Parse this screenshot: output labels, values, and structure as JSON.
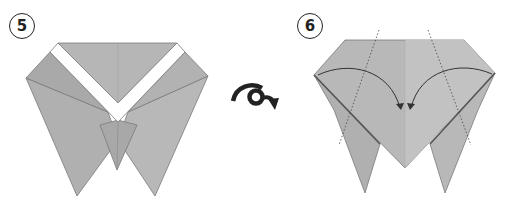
{
  "steps": [
    {
      "number": "5",
      "description": "Model with white V-shaped band across top, two pointed lower flaps"
    },
    {
      "number": "6",
      "description": "Fold side corners to center along dotted lines"
    }
  ],
  "symbols": {
    "turn_over": "turn-over-symbol"
  },
  "colors": {
    "paper": "#b3b3b3",
    "paper_light": "#c4c4c4",
    "paper_dark": "#9d9d9d",
    "white_band": "#ffffff",
    "line": "#555555",
    "arrow": "#3a3a3a"
  }
}
